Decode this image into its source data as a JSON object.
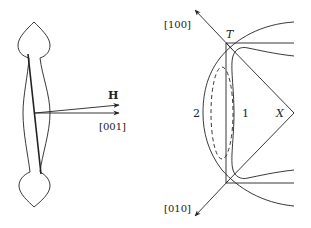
{
  "left_figure": {
    "field_label": "H",
    "axis_label": "[001]"
  },
  "right_figure": {
    "top_axis_label": "[100]",
    "bottom_axis_label": "[010]",
    "point_T": "T",
    "point_X": "X",
    "curve_1_label": "1",
    "curve_2_label": "2"
  },
  "colors": {
    "stroke": "#222222",
    "background": "#ffffff"
  }
}
